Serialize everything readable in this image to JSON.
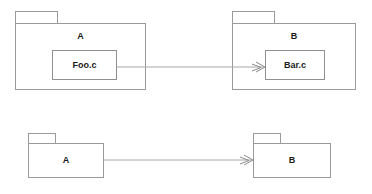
{
  "diagram": {
    "type": "uml-package-dependency-diagram",
    "background_color": "#ffffff",
    "line_color": "#9a9a9a",
    "arrow_color": "#a8a8a8",
    "text_color": "#1a1a1a",
    "rows": [
      {
        "id": "detailed-row",
        "description": "Packages with contained source files and a file-to-file dependency",
        "source_package": {
          "name": "A",
          "contains": {
            "name": "Foo.c"
          }
        },
        "target_package": {
          "name": "B",
          "contains": {
            "name": "Bar.c"
          }
        },
        "dependency": {
          "from": "Foo.c",
          "to": "Bar.c",
          "arrowhead": "open-arrow"
        }
      },
      {
        "id": "summary-row",
        "description": "Same dependency summarized at package level",
        "source_package": {
          "name": "A",
          "contains": null
        },
        "target_package": {
          "name": "B",
          "contains": null
        },
        "dependency": {
          "from": "A",
          "to": "B",
          "arrowhead": "open-arrow"
        }
      }
    ]
  }
}
